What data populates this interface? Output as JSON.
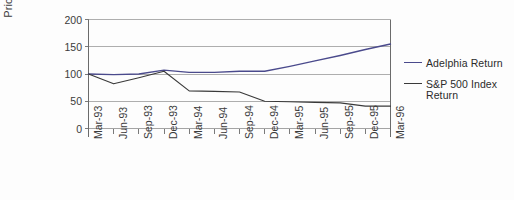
{
  "chart_data": {
    "type": "line",
    "title": "",
    "xlabel": "",
    "ylabel": "Price index",
    "ylim": [
      0,
      200
    ],
    "yticks": [
      0,
      50,
      100,
      150,
      200
    ],
    "grid": true,
    "legend_position": "right",
    "categories": [
      "Mar-93",
      "Jun-93",
      "Sep-93",
      "Dec-93",
      "Mar-94",
      "Jun-94",
      "Sep-94",
      "Dec-94",
      "Mar-95",
      "Jun-95",
      "Sep-95",
      "Dec-95",
      "Mar-96"
    ],
    "series": [
      {
        "name": "Adelphia Return",
        "color": "#4a4a8c",
        "values": [
          100,
          99,
          100,
          107,
          103,
          103,
          105,
          105,
          114,
          124,
          134,
          145,
          155
        ]
      },
      {
        "name": "S&P 500 Index Return",
        "color": "#3a3a3a",
        "values": [
          100,
          82,
          93,
          105,
          69,
          68,
          67,
          50,
          49,
          48,
          47,
          41,
          41
        ]
      }
    ]
  },
  "legend": {
    "entries": [
      {
        "label": "Adelphia Return"
      },
      {
        "label": "S&P 500 Index Return"
      }
    ]
  },
  "axes": {
    "y_title": "Price index",
    "y_tick_labels": [
      "200",
      "150",
      "100",
      "50",
      "0"
    ],
    "x_tick_labels": [
      "Mar-93",
      "Jun-93",
      "Sep-93",
      "Dec-93",
      "Mar-94",
      "Jun-94",
      "Sep-94",
      "Dec-94",
      "Mar-95",
      "Jun-95",
      "Sep-95",
      "Dec-95",
      "Mar-96"
    ]
  },
  "colors": {
    "adelphia": "#4a4a8c",
    "sp500": "#3a3a3a",
    "grid": "#9a9a9a",
    "axis": "#6b6b6b",
    "text": "#3b3b3b"
  }
}
